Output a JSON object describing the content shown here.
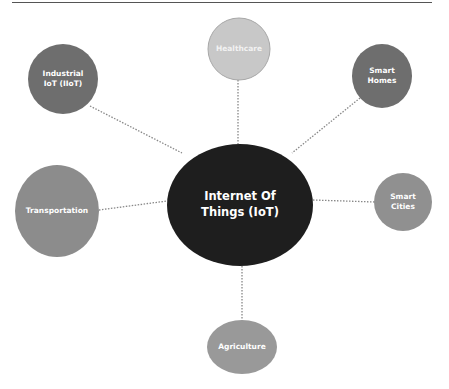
{
  "diagram": {
    "type": "mind-map",
    "center": {
      "label_line1": "Internet Of",
      "label_line2": "Things (IoT)",
      "color": "#1e1e1e",
      "cx": 240,
      "cy": 205,
      "rx": 73,
      "ry": 61
    },
    "nodes": [
      {
        "id": "healthcare",
        "label_line1": "Healthcare",
        "label_line2": "",
        "color": "#c8c8c8",
        "cx": 239,
        "cy": 49,
        "rx": 31,
        "ry": 31
      },
      {
        "id": "industrial-iot",
        "label_line1": "Industrial",
        "label_line2": "IoT (IIoT)",
        "color": "#6e6e6e",
        "cx": 63,
        "cy": 79,
        "rx": 35,
        "ry": 35
      },
      {
        "id": "smart-homes",
        "label_line1": "Smart",
        "label_line2": "Homes",
        "color": "#6e6e6e",
        "cx": 382,
        "cy": 76,
        "rx": 30,
        "ry": 32
      },
      {
        "id": "transportation",
        "label_line1": "Transportation",
        "label_line2": "",
        "color": "#8c8c8c",
        "cx": 57,
        "cy": 211,
        "rx": 42,
        "ry": 46
      },
      {
        "id": "smart-cities",
        "label_line1": "Smart",
        "label_line2": "Cities",
        "color": "#909090",
        "cx": 403,
        "cy": 202,
        "rx": 29,
        "ry": 29
      },
      {
        "id": "agriculture",
        "label_line1": "Agriculture",
        "label_line2": "",
        "color": "#999999",
        "cx": 242,
        "cy": 347,
        "rx": 35,
        "ry": 27
      }
    ],
    "connector_color": "#888888"
  }
}
